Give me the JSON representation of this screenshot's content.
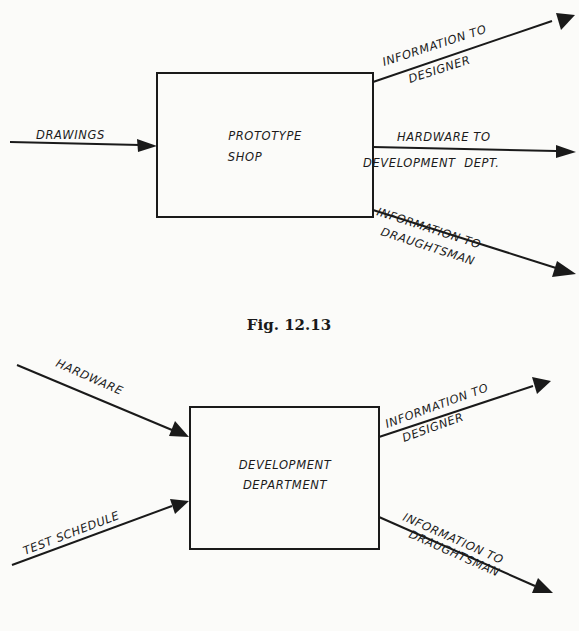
{
  "figure_1": {
    "box_label": [
      "PROTOTYPE",
      "SHOP"
    ],
    "inputs": [
      {
        "label": [
          "DRAWINGS"
        ]
      }
    ],
    "outputs": [
      {
        "label": [
          "INFORMATION TO",
          "DESIGNER"
        ]
      },
      {
        "label": [
          "HARDWARE TO",
          "DEVELOPMENT  DEPT."
        ]
      },
      {
        "label": [
          "INFORMATION TO",
          "DRAUGHTSMAN"
        ]
      }
    ],
    "caption": "Fig. 12.13"
  },
  "figure_2": {
    "box_label": [
      "DEVELOPMENT",
      "DEPARTMENT"
    ],
    "inputs": [
      {
        "label": [
          "HARDWARE"
        ]
      },
      {
        "label": [
          "TEST SCHEDULE"
        ]
      }
    ],
    "outputs": [
      {
        "label": [
          "INFORMATION TO",
          "DESIGNER"
        ]
      },
      {
        "label": [
          "INFORMATION TO",
          "DRAUGHTSMAN"
        ]
      }
    ]
  }
}
